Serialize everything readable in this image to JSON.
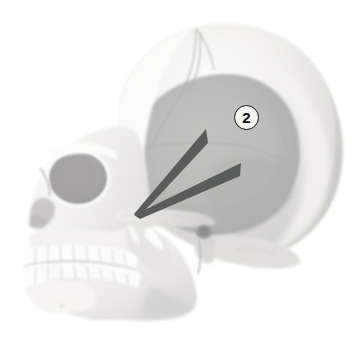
{
  "figure": {
    "label": "v.",
    "view": "lateral view of human skull",
    "background_color": "#ffffff"
  },
  "callouts": [
    {
      "id": "callout-2",
      "number": "2",
      "shape": "circled-number",
      "x": 234,
      "y": 105,
      "diameter": 25,
      "border_color": "#141414",
      "fill_color": "#f4f4f2",
      "text_color": "#101010"
    }
  ],
  "pointers": [
    {
      "name": "upper-wedge-pointer",
      "color": "#5a5c5c",
      "apex_x": 135,
      "apex_y": 213,
      "tip_x": 206,
      "tip_y": 131
    },
    {
      "name": "lower-wedge-pointer",
      "color": "#5a5c5c",
      "apex_x": 135,
      "apex_y": 214,
      "tip_x": 241,
      "tip_y": 166
    }
  ],
  "palette": {
    "bone_light": "#f2f1ef",
    "bone_mid": "#dcdbd8",
    "bone_shadow": "#c3c2bf",
    "cranium_highlight": "#fafafa",
    "temporal_fossa": "#b9b9b6",
    "orbit_dark": "#a9a8a5",
    "outline": "#9e9d9a",
    "tooth_white": "#fcfcfa",
    "pointer_gray": "#5a5c5c",
    "text_dark": "#2b2b2b"
  },
  "anatomy_regions": [
    {
      "name": "frontal-bone",
      "tone": "#f3f2f0"
    },
    {
      "name": "parietal-bone",
      "tone": "#e6e5e2"
    },
    {
      "name": "temporal-fossa",
      "tone": "#b8b8b5"
    },
    {
      "name": "occipital-bone",
      "tone": "#cfcecb"
    },
    {
      "name": "orbit",
      "tone": "#a9a8a5"
    },
    {
      "name": "nasal-aperture",
      "tone": "#cbcac7"
    },
    {
      "name": "maxilla",
      "tone": "#eceae7"
    },
    {
      "name": "mandible",
      "tone": "#eae8e5"
    },
    {
      "name": "zygomatic-arch",
      "tone": "#ddddd9"
    },
    {
      "name": "upper-teeth",
      "tone": "#fcfcfa"
    },
    {
      "name": "lower-teeth",
      "tone": "#fcfcfa"
    },
    {
      "name": "coronal-suture",
      "tone": "#b0afac"
    },
    {
      "name": "mastoid-process",
      "tone": "#d7d6d3"
    },
    {
      "name": "external-acoustic-meatus",
      "tone": "#9b9a97"
    }
  ]
}
